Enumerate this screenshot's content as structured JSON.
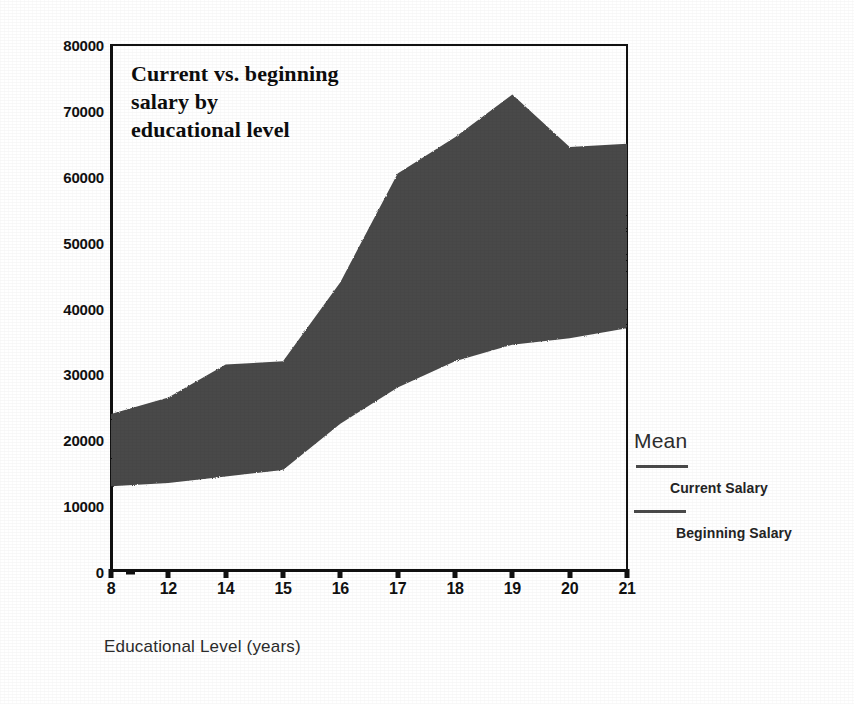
{
  "chart_data": {
    "type": "area",
    "title": "Current vs. beginning salary by educational level",
    "title_lines": [
      "Current vs. beginning",
      "salary by",
      "educational level"
    ],
    "xlabel": "Educational Level (years)",
    "ylabel": "",
    "categories": [
      "8",
      "12",
      "14",
      "15",
      "16",
      "17",
      "18",
      "19",
      "20",
      "21"
    ],
    "x": [
      8,
      12,
      14,
      15,
      16,
      17,
      18,
      19,
      20,
      21
    ],
    "series": [
      {
        "name": "Current Salary",
        "values": [
          24000,
          26500,
          31500,
          32000,
          44000,
          60500,
          66000,
          72500,
          64500,
          65000
        ]
      },
      {
        "name": "Beginning Salary",
        "values": [
          13000,
          13500,
          14500,
          15500,
          22500,
          28000,
          32000,
          34500,
          35500,
          37000
        ]
      }
    ],
    "ylim": [
      0,
      80000
    ],
    "y_ticks": [
      0,
      10000,
      20000,
      30000,
      40000,
      50000,
      60000,
      70000,
      80000
    ],
    "y_tick_labels": [
      "0",
      "10000",
      "20000",
      "30000",
      "40000",
      "50000",
      "60000",
      "70000",
      "80000"
    ],
    "grid": false,
    "legend_position": "right",
    "band_fill_color": "#4a4a4a",
    "axis_color": "#111111",
    "background_color": "#ffffff"
  },
  "legend": {
    "title": "Mean",
    "entries": [
      {
        "label": "Current Salary",
        "color": "#4a4a4a"
      },
      {
        "label": "Beginning Salary",
        "color": "#4a4a4a"
      }
    ]
  }
}
